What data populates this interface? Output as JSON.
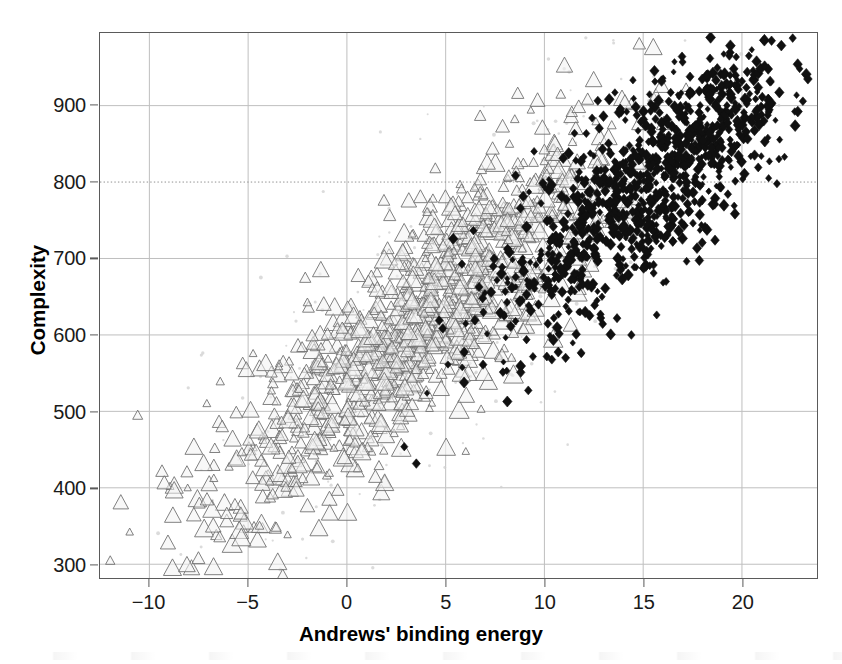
{
  "chart_data": {
    "type": "scatter",
    "title": "",
    "xlabel": "Andrews' binding energy",
    "ylabel": "Complexity",
    "xlim": [
      -12.5,
      23.8
    ],
    "ylim": [
      282,
      995
    ],
    "xticks": [
      -10,
      -5,
      0,
      5,
      10,
      15,
      20
    ],
    "xtick_labels": [
      "−10",
      "−5",
      "0",
      "5",
      "10",
      "15",
      "20"
    ],
    "yticks": [
      300,
      400,
      500,
      600,
      700,
      800,
      900
    ],
    "ytick_labels": [
      "300",
      "400",
      "500",
      "600",
      "700",
      "800",
      "900"
    ],
    "grid": true,
    "grid_color": "#bfbfbf",
    "grid_style_default": "solid",
    "grid_dotted_at_y": 800,
    "legend": "none",
    "frame_color": "#5a5a5a",
    "background": "#ffffff",
    "series": [
      {
        "name": "open triangles",
        "marker": "triangle-open",
        "color": "#6e6e6e",
        "fill": "#f2f2f2",
        "n": 1150,
        "x_mean": 3.6,
        "x_sd": 5.2,
        "slope": 21.5,
        "intercept": 540,
        "resid_sd": 66,
        "size_min": 4,
        "size_max": 11
      },
      {
        "name": "black diamonds",
        "marker": "diamond-filled",
        "color": "#101010",
        "fill": "#101010",
        "n": 1050,
        "x_mean": 15.4,
        "x_sd": 4.0,
        "slope": 21.0,
        "intercept": 480,
        "resid_sd": 60,
        "size_min": 3,
        "size_max": 6
      },
      {
        "name": "faint speckle",
        "marker": "dot-faint",
        "color": "#cfcfcf",
        "fill": "#cfcfcf",
        "n": 260,
        "x_mean": 5.0,
        "x_sd": 7.0,
        "slope": 21.0,
        "intercept": 520,
        "resid_sd": 120,
        "size_min": 2,
        "size_max": 4
      }
    ]
  },
  "figure": {
    "xaxis_title": "Andrews' binding energy",
    "yaxis_title": "Complexity"
  }
}
